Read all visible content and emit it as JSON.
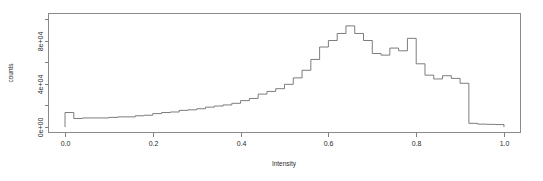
{
  "figure": {
    "background_color": "#ffffff",
    "line_color": "#6e6e6e",
    "axis_color": "#808080",
    "text_color": "#2b2b2b"
  },
  "chart_data": {
    "type": "bar",
    "title": "",
    "subtitle": "",
    "xlabel": "Intensity",
    "ylabel": "counts",
    "xlim": [
      0.0,
      1.0
    ],
    "ylim": [
      0,
      100000
    ],
    "grid": false,
    "legend": null,
    "xticks": [
      "0.0",
      "0.2",
      "0.4",
      "0.6",
      "0.8",
      "1.0"
    ],
    "xtick_values": [
      0.0,
      0.2,
      0.4,
      0.6,
      0.8,
      1.0
    ],
    "yticks": [
      "0e+00",
      "4e+04",
      "8e+04"
    ],
    "ytick_values": [
      0,
      40000,
      80000
    ],
    "minor_yticks": [
      20000,
      60000,
      100000
    ],
    "bin_width": 0.02,
    "bin_edges": [
      0.0,
      0.02,
      0.04,
      0.06,
      0.08,
      0.1,
      0.12,
      0.14,
      0.16,
      0.18,
      0.2,
      0.22,
      0.24,
      0.26,
      0.28,
      0.3,
      0.32,
      0.34,
      0.36,
      0.38,
      0.4,
      0.42,
      0.44,
      0.46,
      0.48,
      0.5,
      0.52,
      0.54,
      0.56,
      0.58,
      0.6,
      0.62,
      0.64,
      0.66,
      0.68,
      0.7,
      0.72,
      0.74,
      0.76,
      0.78,
      0.8,
      0.82,
      0.84,
      0.86,
      0.88,
      0.9,
      0.92,
      0.94,
      0.96,
      0.98,
      1.0
    ],
    "categories": [
      "0.01",
      "0.03",
      "0.05",
      "0.07",
      "0.09",
      "0.11",
      "0.13",
      "0.15",
      "0.17",
      "0.19",
      "0.21",
      "0.23",
      "0.25",
      "0.27",
      "0.29",
      "0.31",
      "0.33",
      "0.35",
      "0.37",
      "0.39",
      "0.41",
      "0.43",
      "0.45",
      "0.47",
      "0.49",
      "0.51",
      "0.53",
      "0.55",
      "0.57",
      "0.59",
      "0.61",
      "0.63",
      "0.65",
      "0.67",
      "0.69",
      "0.71",
      "0.73",
      "0.75",
      "0.77",
      "0.79",
      "0.81",
      "0.83",
      "0.85",
      "0.87",
      "0.89",
      "0.91",
      "0.93",
      "0.95",
      "0.97",
      "0.99"
    ],
    "values": [
      13500,
      8000,
      8500,
      8500,
      8500,
      9000,
      9500,
      9500,
      10500,
      11000,
      12500,
      13500,
      14000,
      15500,
      16000,
      17000,
      18500,
      19500,
      20500,
      22000,
      24500,
      26500,
      30500,
      33000,
      35500,
      39500,
      45500,
      52500,
      62500,
      74000,
      80000,
      86500,
      93500,
      86500,
      80000,
      68000,
      66500,
      73000,
      70500,
      82000,
      58500,
      48000,
      44500,
      47500,
      45000,
      40500,
      3500,
      2800,
      2600,
      2400
    ]
  }
}
